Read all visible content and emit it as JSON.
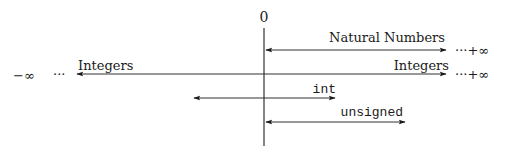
{
  "diagram": {
    "axis": {
      "origin_label": "0"
    },
    "ranges": [
      {
        "id": "natural-numbers",
        "label": "Natural Numbers",
        "right_end": "···+∞"
      },
      {
        "id": "integers",
        "label_left": "Integers",
        "label_right": "Integers",
        "left_end": "−∞",
        "left_dots": "···",
        "right_end": "···+∞"
      },
      {
        "id": "int",
        "label": "int"
      },
      {
        "id": "unsigned",
        "label": "unsigned"
      }
    ]
  }
}
